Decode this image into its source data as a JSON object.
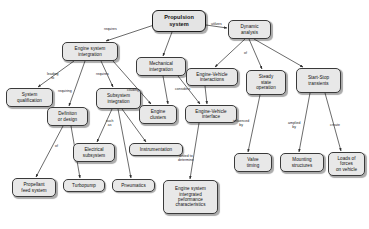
{
  "diagram": {
    "colors": {
      "node_fill": "#e8e8e8",
      "node_border": "#3a3a3a",
      "edge_stroke": "#2b2b2b",
      "background": "#ffffff",
      "text": "#111111"
    },
    "nodes": [
      {
        "id": "propulsion-system",
        "label": "Propulsion\nsystem",
        "x": 152,
        "y": 10,
        "w": 54,
        "h": 22
      },
      {
        "id": "engine-system-integration",
        "label": "Engine system\nintergration",
        "x": 62,
        "y": 42,
        "w": 56,
        "h": 19
      },
      {
        "id": "mechanical-integration",
        "label": "Mechanical\nintergration",
        "x": 136,
        "y": 57,
        "w": 50,
        "h": 19
      },
      {
        "id": "dynamic-analysis",
        "label": "Dynamic\nanalysis",
        "x": 228,
        "y": 20,
        "w": 43,
        "h": 19
      },
      {
        "id": "engine-vehicle-interactions",
        "label": "Engine-Vehicle\ninteractions",
        "x": 186,
        "y": 68,
        "w": 52,
        "h": 18
      },
      {
        "id": "steady-state-operation",
        "label": "Steady\nstate\noperation",
        "x": 246,
        "y": 70,
        "w": 40,
        "h": 25
      },
      {
        "id": "start-stop-transients",
        "label": "Start-Stop\ntransients",
        "x": 296,
        "y": 68,
        "w": 45,
        "h": 25
      },
      {
        "id": "system-qualification",
        "label": "System\nqualification",
        "x": 6,
        "y": 88,
        "w": 47,
        "h": 19
      },
      {
        "id": "definition-or-design",
        "label": "Definiton\nor design",
        "x": 47,
        "y": 107,
        "w": 41,
        "h": 19
      },
      {
        "id": "subsystem-integration",
        "label": "Subsystem\nintegration",
        "x": 96,
        "y": 88,
        "w": 45,
        "h": 21
      },
      {
        "id": "engine-clusters",
        "label": "Engine\nclusters",
        "x": 139,
        "y": 105,
        "w": 38,
        "h": 19
      },
      {
        "id": "engine-vehicle-interface",
        "label": "Engine-Vehicle\ninterface",
        "x": 185,
        "y": 105,
        "w": 52,
        "h": 18
      },
      {
        "id": "electrical-subsystem",
        "label": "Electrical\nsubsystem",
        "x": 73,
        "y": 143,
        "w": 42,
        "h": 19
      },
      {
        "id": "instrumentation",
        "label": "Instrumentation",
        "x": 129,
        "y": 143,
        "w": 54,
        "h": 13
      },
      {
        "id": "propellant-feed-system",
        "label": "Propellant\nfeed system",
        "x": 12,
        "y": 178,
        "w": 44,
        "h": 19
      },
      {
        "id": "turbopump",
        "label": "Turbopump",
        "x": 63,
        "y": 179,
        "w": 42,
        "h": 13
      },
      {
        "id": "pneumatics",
        "label": "Pneumatics",
        "x": 112,
        "y": 179,
        "w": 43,
        "h": 13
      },
      {
        "id": "engine-system-integrated-performance",
        "label": "Engine system\nintergrated\npeformance\ncharacteristics",
        "x": 163,
        "y": 180,
        "w": 55,
        "h": 34
      },
      {
        "id": "valve-timing",
        "label": "Valve\ntiming",
        "x": 234,
        "y": 153,
        "w": 38,
        "h": 19
      },
      {
        "id": "mounting-structures",
        "label": "Mounting\nstructures",
        "x": 280,
        "y": 153,
        "w": 44,
        "h": 19
      },
      {
        "id": "loads-of-forces",
        "label": "Loads of\nforces\non vehicle",
        "x": 328,
        "y": 152,
        "w": 37,
        "h": 24
      }
    ],
    "edges": [
      {
        "id": "e-root-engine-system-integration",
        "from": "propulsion-system",
        "to": "engine-system-integration",
        "label": "requires",
        "lx": 104,
        "ly": 28,
        "x1": 154,
        "y1": 25,
        "x2": 106,
        "y2": 41
      },
      {
        "id": "e-root-mechanical-integration",
        "from": "propulsion-system",
        "to": "mechanical-integration",
        "label": "",
        "lx": 0,
        "ly": 0,
        "x1": 172,
        "y1": 32,
        "x2": 163,
        "y2": 56
      },
      {
        "id": "e-root-dynamic-analysis",
        "from": "propulsion-system",
        "to": "dynamic-analysis",
        "label": "utilizes",
        "lx": 211,
        "ly": 23,
        "x1": 206,
        "y1": 25,
        "x2": 227,
        "y2": 28
      },
      {
        "id": "e-dynamic-of",
        "from": "dynamic-analysis",
        "to": "engine-vehicle-interactions",
        "label": "of",
        "lx": 244,
        "ly": 52,
        "x1": 245,
        "y1": 39,
        "x2": 215,
        "y2": 67
      },
      {
        "id": "e-dynamic-steady",
        "from": "dynamic-analysis",
        "to": "steady-state-operation",
        "label": "",
        "lx": 0,
        "ly": 0,
        "x1": 249,
        "y1": 39,
        "x2": 262,
        "y2": 69
      },
      {
        "id": "e-dynamic-startstop",
        "from": "dynamic-analysis",
        "to": "start-stop-transients",
        "label": "",
        "lx": 0,
        "ly": 0,
        "x1": 254,
        "y1": 39,
        "x2": 303,
        "y2": 67
      },
      {
        "id": "e-esi-system-qualification",
        "from": "engine-system-integration",
        "to": "system-qualification",
        "label": "leading\nto",
        "lx": 47,
        "ly": 73,
        "x1": 74,
        "y1": 61,
        "x2": 38,
        "y2": 87
      },
      {
        "id": "e-esi-definition",
        "from": "engine-system-integration",
        "to": "definition-or-design",
        "label": "requiring",
        "lx": 58,
        "ly": 90,
        "x1": 85,
        "y1": 61,
        "x2": 69,
        "y2": 106
      },
      {
        "id": "e-esi-subsystem",
        "from": "engine-system-integration",
        "to": "subsystem-integration",
        "label": "requires",
        "lx": 96,
        "ly": 73,
        "x1": 101,
        "y1": 61,
        "x2": 113,
        "y2": 87
      },
      {
        "id": "e-esi-engine-clusters",
        "from": "engine-system-integration",
        "to": "engine-clusters",
        "label": "ciluding",
        "lx": 127,
        "ly": 89,
        "x1": 113,
        "y1": 61,
        "x2": 151,
        "y2": 104
      },
      {
        "id": "e-mech-engine-clusters",
        "from": "mechanical-integration",
        "to": "engine-clusters",
        "label": "considers",
        "lx": 175,
        "ly": 88,
        "x1": 163,
        "y1": 76,
        "x2": 168,
        "y2": 104
      },
      {
        "id": "e-mech-evi",
        "from": "mechanical-integration",
        "to": "engine-vehicle-interface",
        "label": "",
        "lx": 0,
        "ly": 0,
        "x1": 178,
        "y1": 76,
        "x2": 200,
        "y2": 104
      },
      {
        "id": "e-evinteractions-evinterface",
        "from": "engine-vehicle-interactions",
        "to": "engine-vehicle-interface",
        "label": "",
        "lx": 0,
        "ly": 0,
        "x1": 205,
        "y1": 86,
        "x2": 207,
        "y2": 104
      },
      {
        "id": "e-definition-propellant",
        "from": "definition-or-design",
        "to": "propellant-feed-system",
        "label": "of",
        "lx": 55,
        "ly": 145,
        "x1": 63,
        "y1": 126,
        "x2": 36,
        "y2": 177
      },
      {
        "id": "e-definition-turbopump",
        "from": "definition-or-design",
        "to": "turbopump",
        "label": "",
        "lx": 0,
        "ly": 0,
        "x1": 71,
        "y1": 126,
        "x2": 80,
        "y2": 178
      },
      {
        "id": "e-subsystem-electrical",
        "from": "subsystem-integration",
        "to": "electrical-subsystem",
        "label": "such\nas",
        "lx": 106,
        "ly": 120,
        "x1": 112,
        "y1": 109,
        "x2": 97,
        "y2": 142
      },
      {
        "id": "e-subsystem-instrumentation",
        "from": "subsystem-integration",
        "to": "instrumentation",
        "label": "",
        "lx": 0,
        "ly": 0,
        "x1": 122,
        "y1": 109,
        "x2": 146,
        "y2": 142
      },
      {
        "id": "e-subsystem-pneumatics",
        "from": "subsystem-integration",
        "to": "pneumatics",
        "label": "",
        "lx": 0,
        "ly": 0,
        "x1": 118,
        "y1": 109,
        "x2": 131,
        "y2": 178
      },
      {
        "id": "e-evinterface-performance",
        "from": "engine-vehicle-interface",
        "to": "engine-system-integrated-performance",
        "label": "tested to\ndetermine",
        "lx": 178,
        "ly": 155,
        "x1": 199,
        "y1": 123,
        "x2": 190,
        "y2": 179
      },
      {
        "id": "e-steady-valve",
        "from": "steady-state-operation",
        "to": "valve-timing",
        "label": "influenced\nby",
        "lx": 233,
        "ly": 120,
        "x1": 260,
        "y1": 95,
        "x2": 248,
        "y2": 152
      },
      {
        "id": "e-startstop-mounting",
        "from": "start-stop-transients",
        "to": "mounting-structures",
        "label": "amplied\nby",
        "lx": 288,
        "ly": 122,
        "x1": 310,
        "y1": 93,
        "x2": 299,
        "y2": 152
      },
      {
        "id": "e-startstop-loads",
        "from": "start-stop-transients",
        "to": "loads-of-forces",
        "label": "create",
        "lx": 330,
        "ly": 124,
        "x1": 325,
        "y1": 93,
        "x2": 341,
        "y2": 151
      }
    ]
  }
}
